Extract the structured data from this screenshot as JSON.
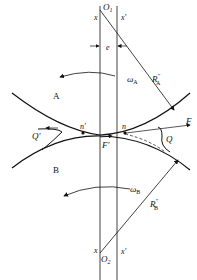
{
  "diagram": {
    "title": "",
    "labels": {
      "O1": "O",
      "O1_sub": "1",
      "O2": "O",
      "O2_sub": "2",
      "x_top": "x",
      "x_prime_top": "x'",
      "x_bottom": "x",
      "x_prime_bottom": "x'",
      "e": "e",
      "omega_A": "ω",
      "omega_A_sub": "A",
      "omega_B": "ω",
      "omega_B_sub": "B",
      "R_A": "R",
      "R_A_sup": "\"",
      "R_A_sub": "A",
      "R_B": "R",
      "R_B_sup": "\"",
      "R_B_sub": "B",
      "body_A": "A",
      "body_B": "B",
      "n": "n",
      "n_prime": "n'",
      "Q": "Q",
      "Q_prime": "Q'",
      "F": "F",
      "F_prime": "F'"
    },
    "line_color": "#111111"
  }
}
